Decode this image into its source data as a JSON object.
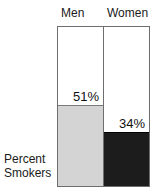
{
  "chart_data": {
    "type": "bar",
    "title": "",
    "subtitle": "",
    "xlabel": "",
    "ylabel": "Percent Smokers",
    "ylabel_lines": [
      "Percent",
      "Smokers"
    ],
    "categories": [
      "Men",
      "Women"
    ],
    "values": [
      51,
      34
    ],
    "value_labels": [
      "51%",
      "34%"
    ],
    "ylim": [
      0,
      100
    ],
    "grid": false,
    "legend": "none",
    "series": [
      {
        "name": "Percent Smokers",
        "values": [
          51,
          34
        ],
        "point_colors": [
          "#d4d4d4",
          "#1c1c1c"
        ]
      }
    ],
    "colors": {
      "men_fill": "#d4d4d4",
      "women_fill": "#1c1c1c",
      "panel_background": "#ffffff",
      "frame_stroke": "#6e6e6e",
      "text": "#1a1a1a"
    }
  },
  "header": {
    "columns": [
      {
        "label": "Men"
      },
      {
        "label": "Women"
      }
    ]
  },
  "plot": {
    "bars": [
      {
        "category": "Men",
        "value_label": "51%"
      },
      {
        "category": "Women",
        "value_label": "34%"
      }
    ]
  },
  "caption": {
    "line1": "Percent",
    "line2": "Smokers"
  }
}
